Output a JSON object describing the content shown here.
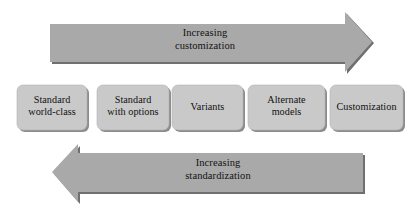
{
  "diagram": {
    "background_color": "#ffffff",
    "arrow_fill": "#a9a9a9",
    "arrow_shadow": "#6e6e6e",
    "box_fill": "#c9c9c9",
    "box_shadow": "#8a8a8a",
    "text_color": "#101010",
    "top_arrow": {
      "name": "increasing-customization-arrow",
      "direction": "right",
      "line1": "Increasing",
      "line2": "customization"
    },
    "bottom_arrow": {
      "name": "increasing-standardization-arrow",
      "direction": "left",
      "line1": "Increasing",
      "line2": "standardization"
    },
    "boxes": [
      {
        "id": "standard-world-class",
        "line1": "Standard",
        "line2": "world-class"
      },
      {
        "id": "standard-with-options",
        "line1": "Standard",
        "line2": "with options"
      },
      {
        "id": "variants",
        "line1": "Variants",
        "line2": ""
      },
      {
        "id": "alternate-models",
        "line1": "Alternate",
        "line2": "models"
      },
      {
        "id": "customization",
        "line1": "Customization",
        "line2": ""
      }
    ]
  }
}
